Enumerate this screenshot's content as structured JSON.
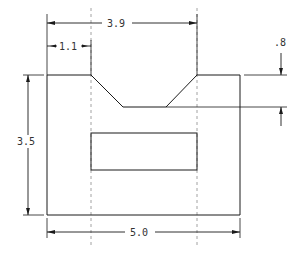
{
  "drawing": {
    "type": "orthographic-front-view",
    "colors": {
      "line": "#1a1a1a",
      "text": "#333333",
      "hidden": "#8a8a8a",
      "background": "#ffffff"
    },
    "dimensions": {
      "overall_width": {
        "label": "5.0",
        "value": 5.0
      },
      "overall_height": {
        "label": "3.5",
        "value": 3.5
      },
      "notch_right_edge_from_left": {
        "label": "3.9",
        "value": 3.9
      },
      "notch_left_edge_from_left": {
        "label": "1.1",
        "value": 1.1
      },
      "notch_depth": {
        "label": ".8",
        "value": 0.8
      }
    },
    "features": [
      {
        "name": "outer-profile",
        "description": "rectangular block with trapezoidal V-notch on top"
      },
      {
        "name": "rectangular-slot",
        "description": "inner rectangle aligned with notch edges"
      },
      {
        "name": "hidden-lines",
        "description": "two vertical dashed center/projection lines at notch edges"
      }
    ]
  }
}
